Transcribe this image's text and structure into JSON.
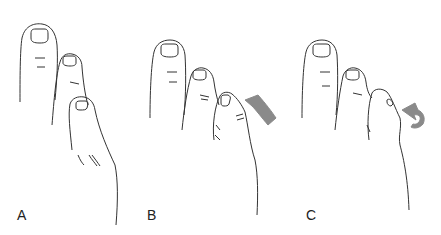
{
  "figure": {
    "panels": [
      {
        "id": "A",
        "label": "A",
        "description": "Normal toes, lesser toe straight"
      },
      {
        "id": "B",
        "label": "B",
        "description": "Lesser toe rotating, arrow indicating rotation"
      },
      {
        "id": "C",
        "label": "C",
        "description": "Lesser toe curled under, curved arrow indicating rotation"
      }
    ],
    "colors": {
      "line": "#333333",
      "arrow_fill": "#8a8a8a",
      "background": "#ffffff"
    }
  }
}
